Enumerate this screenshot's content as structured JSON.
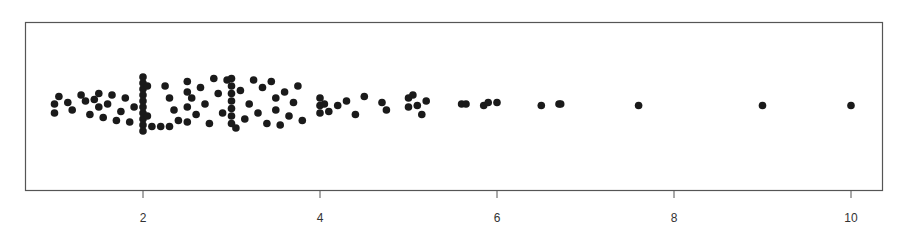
{
  "chart_data": {
    "type": "scatter",
    "subtype": "stripchart-jitter",
    "title": "",
    "xlabel": "",
    "ylabel": "",
    "xlim": [
      0.8,
      10.35
    ],
    "x_ticks": [
      2,
      4,
      6,
      8,
      10
    ],
    "x_tick_labels": [
      "2",
      "4",
      "6",
      "8",
      "10"
    ],
    "grid": false,
    "legend": null,
    "point_color": "#1a1a1a",
    "frame_color": "#555555",
    "note": "Values approximate; dense jittered 1D strip plot, exact points estimated from pixel positions",
    "points": [
      {
        "x": 1.0,
        "j": 0.0
      },
      {
        "x": 1.0,
        "j": -0.3
      },
      {
        "x": 1.05,
        "j": 0.25
      },
      {
        "x": 1.15,
        "j": 0.05
      },
      {
        "x": 1.2,
        "j": -0.2
      },
      {
        "x": 1.3,
        "j": 0.3
      },
      {
        "x": 1.35,
        "j": 0.1
      },
      {
        "x": 1.4,
        "j": -0.35
      },
      {
        "x": 1.45,
        "j": 0.15
      },
      {
        "x": 1.5,
        "j": -0.1
      },
      {
        "x": 1.5,
        "j": 0.35
      },
      {
        "x": 1.55,
        "j": -0.45
      },
      {
        "x": 1.6,
        "j": 0.0
      },
      {
        "x": 1.65,
        "j": 0.3
      },
      {
        "x": 1.7,
        "j": -0.55
      },
      {
        "x": 1.75,
        "j": -0.25
      },
      {
        "x": 1.8,
        "j": 0.2
      },
      {
        "x": 1.85,
        "j": -0.6
      },
      {
        "x": 1.9,
        "j": -0.1
      },
      {
        "x": 2.0,
        "j": 0.9
      },
      {
        "x": 2.0,
        "j": 0.7
      },
      {
        "x": 2.0,
        "j": 0.5
      },
      {
        "x": 2.0,
        "j": 0.3
      },
      {
        "x": 2.0,
        "j": 0.1
      },
      {
        "x": 2.0,
        "j": -0.1
      },
      {
        "x": 2.0,
        "j": -0.3
      },
      {
        "x": 2.0,
        "j": -0.5
      },
      {
        "x": 2.0,
        "j": -0.7
      },
      {
        "x": 2.0,
        "j": -0.9
      },
      {
        "x": 2.05,
        "j": 0.6
      },
      {
        "x": 2.05,
        "j": -0.4
      },
      {
        "x": 2.1,
        "j": -0.75
      },
      {
        "x": 2.2,
        "j": -0.75
      },
      {
        "x": 2.3,
        "j": -0.75
      },
      {
        "x": 2.25,
        "j": 0.6
      },
      {
        "x": 2.3,
        "j": 0.2
      },
      {
        "x": 2.35,
        "j": -0.2
      },
      {
        "x": 2.4,
        "j": -0.55
      },
      {
        "x": 2.5,
        "j": 0.75
      },
      {
        "x": 2.5,
        "j": 0.4
      },
      {
        "x": 2.5,
        "j": -0.1
      },
      {
        "x": 2.5,
        "j": -0.6
      },
      {
        "x": 2.55,
        "j": 0.2
      },
      {
        "x": 2.6,
        "j": -0.35
      },
      {
        "x": 2.65,
        "j": 0.55
      },
      {
        "x": 2.7,
        "j": 0.0
      },
      {
        "x": 2.75,
        "j": -0.65
      },
      {
        "x": 2.8,
        "j": 0.85
      },
      {
        "x": 2.85,
        "j": 0.35
      },
      {
        "x": 2.9,
        "j": -0.3
      },
      {
        "x": 2.95,
        "j": 0.8
      },
      {
        "x": 3.0,
        "j": 0.85
      },
      {
        "x": 3.0,
        "j": 0.6
      },
      {
        "x": 3.0,
        "j": 0.35
      },
      {
        "x": 3.0,
        "j": 0.1
      },
      {
        "x": 3.0,
        "j": -0.15
      },
      {
        "x": 3.0,
        "j": -0.4
      },
      {
        "x": 3.0,
        "j": -0.65
      },
      {
        "x": 3.05,
        "j": -0.8
      },
      {
        "x": 3.1,
        "j": 0.45
      },
      {
        "x": 3.15,
        "j": -0.5
      },
      {
        "x": 3.2,
        "j": 0.0
      },
      {
        "x": 3.25,
        "j": 0.8
      },
      {
        "x": 3.3,
        "j": -0.3
      },
      {
        "x": 3.35,
        "j": 0.55
      },
      {
        "x": 3.4,
        "j": -0.65
      },
      {
        "x": 3.45,
        "j": 0.75
      },
      {
        "x": 3.5,
        "j": 0.2
      },
      {
        "x": 3.5,
        "j": -0.2
      },
      {
        "x": 3.55,
        "j": -0.7
      },
      {
        "x": 3.6,
        "j": 0.4
      },
      {
        "x": 3.65,
        "j": -0.4
      },
      {
        "x": 3.7,
        "j": 0.05
      },
      {
        "x": 3.75,
        "j": 0.6
      },
      {
        "x": 3.8,
        "j": -0.55
      },
      {
        "x": 4.0,
        "j": 0.2
      },
      {
        "x": 4.0,
        "j": -0.05
      },
      {
        "x": 4.0,
        "j": -0.3
      },
      {
        "x": 4.05,
        "j": 0.0
      },
      {
        "x": 4.1,
        "j": -0.25
      },
      {
        "x": 4.2,
        "j": -0.05
      },
      {
        "x": 4.3,
        "j": 0.1
      },
      {
        "x": 4.4,
        "j": -0.35
      },
      {
        "x": 4.5,
        "j": 0.25
      },
      {
        "x": 4.7,
        "j": 0.05
      },
      {
        "x": 4.75,
        "j": -0.2
      },
      {
        "x": 5.0,
        "j": 0.2
      },
      {
        "x": 5.0,
        "j": -0.1
      },
      {
        "x": 5.05,
        "j": 0.3
      },
      {
        "x": 5.1,
        "j": -0.05
      },
      {
        "x": 5.15,
        "j": -0.35
      },
      {
        "x": 5.2,
        "j": 0.1
      },
      {
        "x": 5.6,
        "j": 0.0
      },
      {
        "x": 5.65,
        "j": 0.0
      },
      {
        "x": 5.85,
        "j": -0.05
      },
      {
        "x": 5.9,
        "j": 0.05
      },
      {
        "x": 6.0,
        "j": 0.05
      },
      {
        "x": 6.5,
        "j": -0.05
      },
      {
        "x": 6.7,
        "j": 0.0
      },
      {
        "x": 6.72,
        "j": 0.0
      },
      {
        "x": 7.6,
        "j": -0.05
      },
      {
        "x": 9.0,
        "j": -0.05
      },
      {
        "x": 10.0,
        "j": -0.05
      }
    ]
  }
}
